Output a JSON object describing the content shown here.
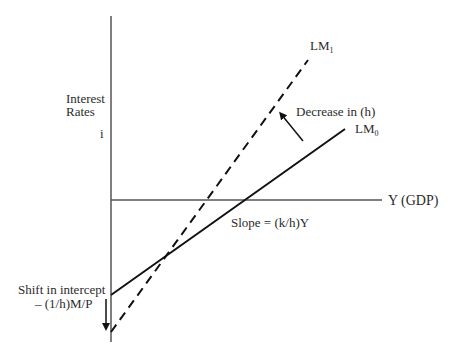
{
  "diagram": {
    "type": "LM curve shift diagram",
    "y_axis": {
      "label_line1": "Interest",
      "label_line2": "Rates",
      "symbol": "i"
    },
    "x_axis": {
      "label": "Y  (GDP)"
    },
    "curves": [
      {
        "id": "LM0",
        "name": "LM",
        "subscript": "0",
        "style": "solid"
      },
      {
        "id": "LM1",
        "name": "LM",
        "subscript": "1",
        "style": "dashed"
      }
    ],
    "annotations": {
      "rotation_arrow": "Decrease in (h)",
      "slope": "Slope = (k/h)Y",
      "intercept_line1": "Shift in intercept",
      "intercept_line2": "– (1/h)M/P"
    },
    "colors": {
      "axis": "#555555",
      "curve": "#111111",
      "text": "#2b2b2b"
    }
  }
}
